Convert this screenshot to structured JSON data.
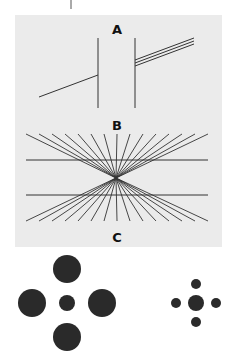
{
  "figure": {
    "panels": [
      {
        "id": "A",
        "label": "A",
        "description": "Poggendorff illusion: oblique line interrupted by two vertical bars"
      },
      {
        "id": "B",
        "label": "B",
        "description": "Hering illusion: two parallel horizontal lines over radiating lines"
      },
      {
        "id": "C",
        "label": "C",
        "description": "Ebbinghaus illusion: identical central circles surrounded by large vs small circles"
      }
    ],
    "colors": {
      "background": "#ffffff",
      "panel": "#ebebeb",
      "ink": "#2a2a2a"
    }
  }
}
